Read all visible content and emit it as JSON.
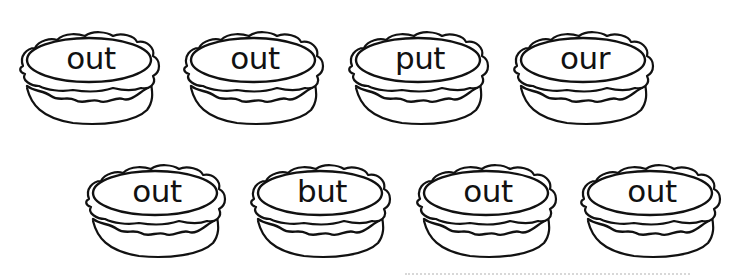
{
  "worksheet": {
    "rows": [
      {
        "pies": [
          {
            "word": "out"
          },
          {
            "word": "out"
          },
          {
            "word": "put"
          },
          {
            "word": "our"
          }
        ]
      },
      {
        "pies": [
          {
            "word": "out"
          },
          {
            "word": "but"
          },
          {
            "word": "out"
          },
          {
            "word": "out"
          }
        ]
      }
    ],
    "colors": {
      "ink": "#111111",
      "background": "#ffffff",
      "dotted_line": "#d8d8d8"
    }
  }
}
